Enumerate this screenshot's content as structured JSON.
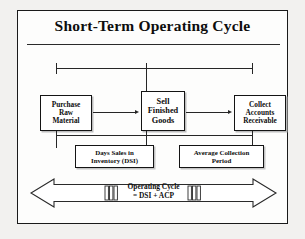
{
  "figure": {
    "title": "Short-Term Operating Cycle",
    "process_boxes": [
      {
        "name": "purchase-raw-material",
        "lines": [
          "Purchase",
          "Raw",
          "Material"
        ]
      },
      {
        "name": "sell-finished-goods",
        "lines": [
          "Sell",
          "Finished",
          "Goods"
        ]
      },
      {
        "name": "collect-accounts-receivable",
        "lines": [
          "Collect",
          "Accounts",
          "Receivable"
        ]
      }
    ],
    "measure_boxes": [
      {
        "name": "days-sales-in-inventory",
        "lines": [
          "Days Sales in",
          "Inventory (DSI)"
        ]
      },
      {
        "name": "average-collection-period",
        "lines": [
          "Average Collection",
          "Period"
        ]
      }
    ],
    "banner": {
      "lines": [
        "Operating Cycle",
        "= DSI + ACP"
      ]
    },
    "colors": {
      "ink": "#0d0d0d",
      "rule": "#262626",
      "frame": "#1a1a1a",
      "paper": "#fdfdfc",
      "page": "#f2f1ef",
      "shadow": "#bdbdbd"
    }
  }
}
